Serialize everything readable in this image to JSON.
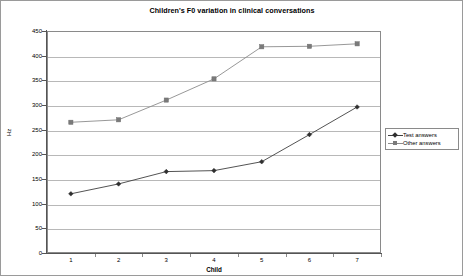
{
  "chart_data": {
    "type": "line",
    "title": "Children's F0 variation in clinical conversations",
    "xlabel": "Child",
    "ylabel": "Hz",
    "categories": [
      "1",
      "2",
      "3",
      "4",
      "5",
      "6",
      "7"
    ],
    "ylim": [
      0,
      450
    ],
    "ytick_step": 50,
    "yticks": [
      "450",
      "400",
      "350",
      "300",
      "250",
      "200",
      "150",
      "100",
      "50",
      "0"
    ],
    "grid": true,
    "legend_position": "right",
    "series": [
      {
        "name": "Test answers",
        "marker": "diamond",
        "color": "#404040",
        "values": [
          120,
          140,
          165,
          167,
          185,
          240,
          296
        ]
      },
      {
        "name": "Other answers",
        "marker": "square",
        "color": "#8c8c8c",
        "values": [
          265,
          270,
          310,
          353,
          418,
          419,
          424
        ]
      }
    ]
  },
  "legend": {
    "items": [
      {
        "label": "Test answers"
      },
      {
        "label": "Other answers"
      }
    ]
  }
}
